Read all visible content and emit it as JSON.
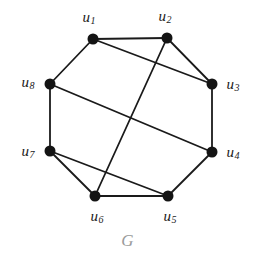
{
  "figure": {
    "caption": "G",
    "caption_color": "#9a9a9a",
    "background_color": "#ffffff",
    "edge_color": "#1a1a1a",
    "vertex_color": "#141414",
    "width": 255,
    "height": 261
  },
  "chart_data": {
    "type": "diagram",
    "title": "G",
    "subtype": "undirected-graph",
    "node_count": 8,
    "edge_count": 12,
    "nodes": [
      {
        "id": "u1",
        "label": "u",
        "sub": "1",
        "x": 93,
        "y": 39,
        "label_x": 89,
        "label_y": 18
      },
      {
        "id": "u2",
        "label": "u",
        "sub": "2",
        "x": 167,
        "y": 38,
        "label_x": 165,
        "label_y": 17
      },
      {
        "id": "u3",
        "label": "u",
        "sub": "3",
        "x": 212,
        "y": 84,
        "label_x": 233,
        "label_y": 85
      },
      {
        "id": "u4",
        "label": "u",
        "sub": "4",
        "x": 212,
        "y": 152,
        "label_x": 233,
        "label_y": 153
      },
      {
        "id": "u5",
        "label": "u",
        "sub": "5",
        "x": 168,
        "y": 196,
        "label_x": 170,
        "label_y": 217
      },
      {
        "id": "u6",
        "label": "u",
        "sub": "6",
        "x": 95,
        "y": 196,
        "label_x": 97,
        "label_y": 217
      },
      {
        "id": "u7",
        "label": "u",
        "sub": "7",
        "x": 50,
        "y": 151,
        "label_x": 28,
        "label_y": 152
      },
      {
        "id": "u8",
        "label": "u",
        "sub": "8",
        "x": 50,
        "y": 84,
        "label_x": 28,
        "label_y": 83
      }
    ],
    "edges": [
      {
        "from": "u1",
        "to": "u2",
        "kind": "cycle"
      },
      {
        "from": "u2",
        "to": "u3",
        "kind": "cycle"
      },
      {
        "from": "u3",
        "to": "u4",
        "kind": "cycle"
      },
      {
        "from": "u4",
        "to": "u5",
        "kind": "cycle"
      },
      {
        "from": "u5",
        "to": "u6",
        "kind": "cycle"
      },
      {
        "from": "u6",
        "to": "u7",
        "kind": "cycle"
      },
      {
        "from": "u7",
        "to": "u8",
        "kind": "cycle"
      },
      {
        "from": "u8",
        "to": "u1",
        "kind": "cycle"
      },
      {
        "from": "u1",
        "to": "u3",
        "kind": "chord"
      },
      {
        "from": "u2",
        "to": "u6",
        "kind": "chord"
      },
      {
        "from": "u8",
        "to": "u4",
        "kind": "chord"
      },
      {
        "from": "u7",
        "to": "u5",
        "kind": "chord"
      }
    ],
    "node_radius": 5.5,
    "edge_width": 1.8
  }
}
